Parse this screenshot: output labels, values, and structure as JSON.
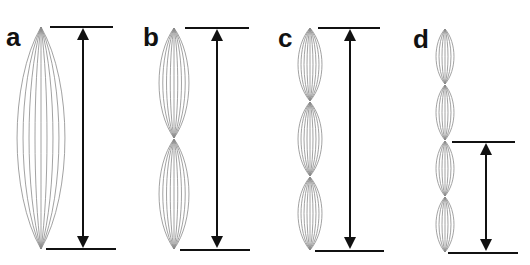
{
  "figure": {
    "caption_partial": "",
    "background": "#ffffff",
    "line_color": "#111111",
    "spindle_color": "#8a8a8a",
    "panels": [
      {
        "label": "a",
        "label_x": 6,
        "label_y": 46,
        "center_x": 41,
        "segments": [
          [
            27,
            249
          ]
        ],
        "half_width": 24,
        "fibers": 9,
        "arrow": {
          "x": 83,
          "y1": 27,
          "y2": 249
        },
        "top_line": {
          "x1": 50,
          "x2": 113,
          "y": 27
        },
        "bottom_line": {
          "x1": 46,
          "x2": 116,
          "y": 249
        }
      },
      {
        "label": "b",
        "label_x": 143,
        "label_y": 46,
        "center_x": 174,
        "segments": [
          [
            28,
            138
          ],
          [
            139,
            249
          ]
        ],
        "half_width": 15,
        "fibers": 9,
        "arrow": {
          "x": 217,
          "y1": 28,
          "y2": 249
        },
        "top_line": {
          "x1": 185,
          "x2": 249,
          "y": 28
        },
        "bottom_line": {
          "x1": 180,
          "x2": 250,
          "y": 250
        }
      },
      {
        "label": "c",
        "label_x": 278,
        "label_y": 47,
        "center_x": 310,
        "segments": [
          [
            28,
            101
          ],
          [
            102,
            176
          ],
          [
            177,
            250
          ]
        ],
        "half_width": 12,
        "fibers": 9,
        "arrow": {
          "x": 350,
          "y1": 28,
          "y2": 250
        },
        "top_line": {
          "x1": 318,
          "x2": 380,
          "y": 28
        },
        "bottom_line": {
          "x1": 315,
          "x2": 384,
          "y": 251
        }
      },
      {
        "label": "d",
        "label_x": 413,
        "label_y": 48,
        "center_x": 445,
        "segments": [
          [
            29,
            84
          ],
          [
            85,
            140
          ],
          [
            141,
            196
          ],
          [
            197,
            252
          ]
        ],
        "half_width": 9,
        "fibers": 7,
        "arrow": {
          "x": 486,
          "y1": 142,
          "y2": 252
        },
        "top_line": {
          "x1": 452,
          "x2": 515,
          "y": 142
        },
        "bottom_line": {
          "x1": 448,
          "x2": 518,
          "y": 253
        }
      }
    ]
  }
}
